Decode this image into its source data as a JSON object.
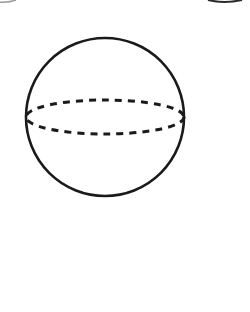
{
  "figure": {
    "subject": "sphere",
    "description": "Outline of a sphere with a dashed equatorial ellipse",
    "background_color": "#ffffff",
    "stroke_color": "#1a1a1a",
    "sphere": {
      "cx": 105,
      "cy": 117,
      "r": 79,
      "stroke_width": 2.6
    },
    "equator": {
      "cx": 105,
      "cy": 117,
      "rx": 79,
      "ry": 17,
      "stroke_width": 3,
      "dash": "7 6"
    },
    "edge_fragments": [
      {
        "name": "top-left-fragment",
        "color": "#9a9a9a"
      },
      {
        "name": "top-right-fragment",
        "color": "#2a2a2a"
      }
    ]
  }
}
